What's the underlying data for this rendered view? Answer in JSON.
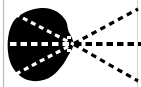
{
  "figure": {
    "name": "radiating-rays-from-blob-vertex",
    "width": 141,
    "height": 87,
    "background_color": "#ffffff",
    "ink_color": "#000000",
    "rule_color": "#b9b9b9",
    "alt_text": "Black blob with three dashed rays converging at a vertex point"
  },
  "elements": {
    "blob": {
      "label": "black-blob",
      "fill": "#000000",
      "center_x": 41,
      "center_y": 45,
      "radius_x": 32,
      "radius_y": 37
    },
    "vertex": {
      "label": "convergence-vertex",
      "x": 73,
      "y": 44
    },
    "rays": [
      {
        "id": "ray-upper",
        "label": "upper-diagonal-ray",
        "inner_start_x": 15,
        "inner_start_y": 14,
        "outer_end_x": 137,
        "outer_end_y": 10,
        "dash_pattern": "5 4"
      },
      {
        "id": "ray-middle",
        "label": "horizontal-axis-ray",
        "inner_start_x": 11,
        "inner_start_y": 44,
        "outer_end_x": 140,
        "outer_end_y": 44,
        "dash_pattern": "6 4"
      },
      {
        "id": "ray-lower",
        "label": "lower-diagonal-ray",
        "inner_start_x": 16,
        "inner_start_y": 74,
        "outer_end_x": 137,
        "outer_end_y": 80,
        "dash_pattern": "5 4"
      }
    ],
    "rules": [
      {
        "id": "rule-left",
        "label": "left-vertical-rule",
        "x": 3,
        "y1": 0,
        "y2": 87,
        "color": "#b9b9b9"
      },
      {
        "id": "rule-right",
        "label": "right-vertical-rule",
        "x": 137,
        "y1": 0,
        "y2": 87,
        "color": "#cfcfcf"
      }
    ]
  }
}
